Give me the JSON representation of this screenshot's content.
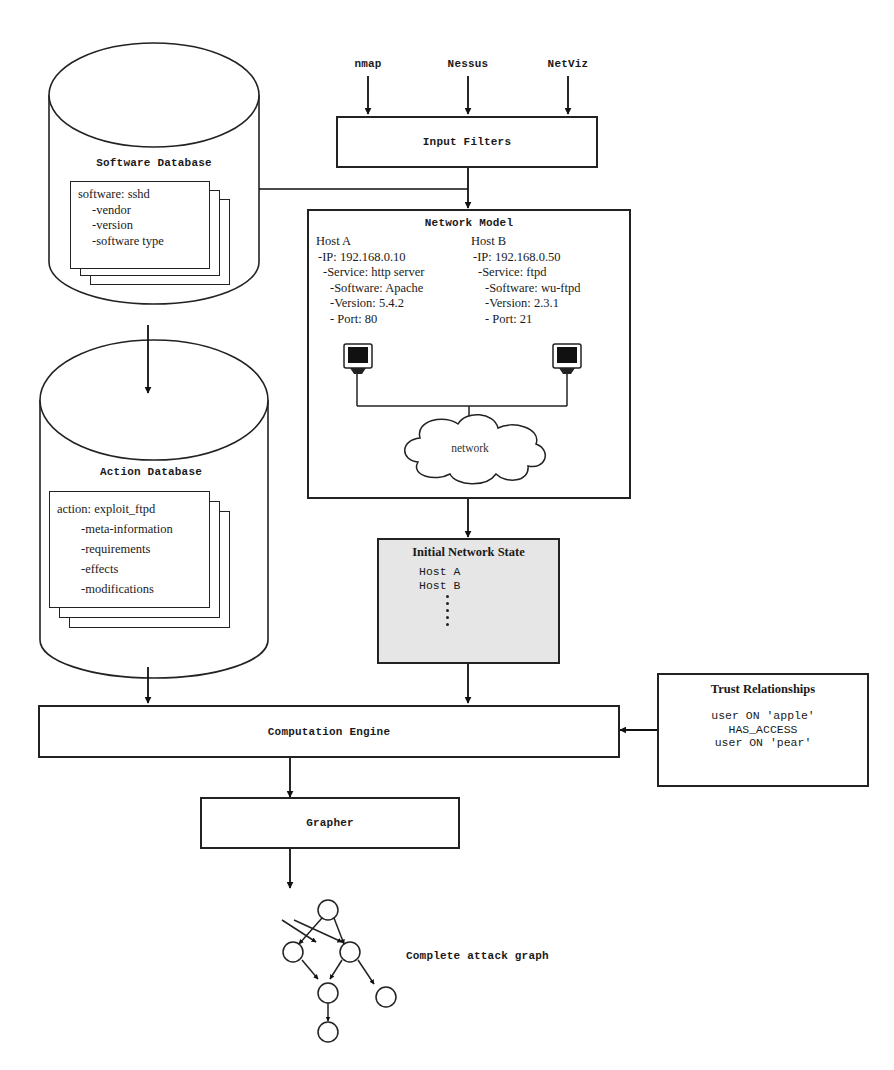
{
  "diagram": {
    "inputs": [
      "nmap",
      "Nessus",
      "NetViz"
    ],
    "input_filters": {
      "label": "Input Filters"
    },
    "software_database": {
      "title": "Software Database",
      "record_title": "software: sshd",
      "fields": [
        "-vendor",
        "-version",
        "-software type"
      ]
    },
    "action_database": {
      "title": "Action Database",
      "record_title": "action: exploit_ftpd",
      "fields": [
        "-meta-information",
        "-requirements",
        "-effects",
        "-modifications"
      ]
    },
    "network_model": {
      "title": "Network Model",
      "hosts": [
        {
          "name": "Host A",
          "ip": "-IP: 192.168.0.10",
          "service": "-Service: http server",
          "software": "-Software: Apache",
          "version": "-Version: 5.4.2",
          "port": "- Port: 80"
        },
        {
          "name": "Host B",
          "ip": "-IP: 192.168.0.50",
          "service": "-Service: ftpd",
          "software": "-Software: wu-ftpd",
          "version": "-Version: 2.3.1",
          "port": "- Port: 21"
        }
      ],
      "cloud_label": "network"
    },
    "initial_network_state": {
      "title": "Initial Network State",
      "hosts": [
        "Host A",
        "Host B"
      ]
    },
    "computation_engine": {
      "label": "Computation Engine"
    },
    "trust_relationships": {
      "title": "Trust Relationships",
      "lines": [
        "user ON 'apple'",
        "HAS_ACCESS",
        "user ON 'pear'"
      ]
    },
    "grapher": {
      "label": "Grapher"
    },
    "attack_graph": {
      "label": "Complete attack graph"
    }
  }
}
